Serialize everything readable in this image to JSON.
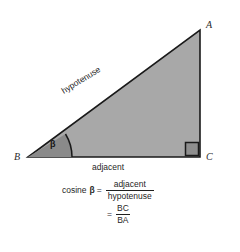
{
  "figure": {
    "background_color": "#ffffff",
    "triangle": {
      "fill_color": "#a8a8a8",
      "stroke_color": "#1a1a1a",
      "vertices": {
        "A": {
          "label": "A",
          "x": 200,
          "y": 30
        },
        "B": {
          "label": "B",
          "x": 28,
          "y": 157
        },
        "C": {
          "label": "C",
          "x": 200,
          "y": 157
        }
      }
    },
    "angle_marker": {
      "label": "β",
      "at_vertex": "B",
      "wedge_fill_color": "#8a8a8a",
      "arc_stroke_color": "#1a1a1a"
    },
    "right_angle_marker": {
      "at_vertex": "C",
      "fill_color": "#8f8f8f",
      "stroke_color": "#1a1a1a"
    },
    "side_labels": {
      "hypotenuse": "hypotenuse",
      "adjacent": "adjacent"
    }
  },
  "formula": {
    "line1": {
      "lhs_word": "cosine",
      "lhs_symbol": "β",
      "equals": "=",
      "numerator": "adjacent",
      "denominator": "hypotenuse"
    },
    "line2": {
      "equals": "=",
      "numerator": "BC",
      "denominator": "BA"
    }
  }
}
